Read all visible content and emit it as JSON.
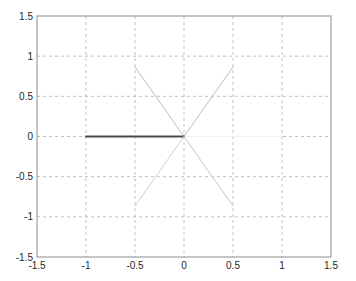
{
  "chart_data": {
    "type": "line",
    "title": "",
    "xlabel": "",
    "ylabel": "",
    "xlim": [
      -1.5,
      1.5
    ],
    "ylim": [
      -1.5,
      1.5
    ],
    "grid": true,
    "legend": null,
    "x_ticks": [
      -1.5,
      -1,
      -0.5,
      0,
      0.5,
      1,
      1.5
    ],
    "x_tick_labels": [
      "-1.5",
      "-1",
      "-0.5",
      "0",
      "0.5",
      "1",
      "1.5"
    ],
    "y_ticks": [
      -1.5,
      -1,
      -0.5,
      0,
      0.5,
      1,
      1.5
    ],
    "y_tick_labels": [
      "-1.5",
      "-1",
      "-0.5",
      "0",
      "0.5",
      "1",
      "1.5"
    ],
    "series": [
      {
        "name": "0deg",
        "x": [
          0,
          1
        ],
        "y": [
          0,
          0
        ],
        "color": "#f2f2f2",
        "width": 1.2
      },
      {
        "name": "60deg",
        "x": [
          0,
          0.5
        ],
        "y": [
          0,
          0.866
        ],
        "color": "#bdbdbd",
        "width": 1
      },
      {
        "name": "120deg",
        "x": [
          0,
          -0.5
        ],
        "y": [
          0,
          0.866
        ],
        "color": "#bdbdbd",
        "width": 1
      },
      {
        "name": "180deg",
        "x": [
          0,
          -1
        ],
        "y": [
          0,
          0
        ],
        "color": "#4a4a4a",
        "width": 2
      },
      {
        "name": "240deg",
        "x": [
          0,
          -0.5
        ],
        "y": [
          0,
          -0.866
        ],
        "color": "#d0d0d0",
        "width": 1
      },
      {
        "name": "300deg",
        "x": [
          0,
          0.5
        ],
        "y": [
          0,
          -0.866
        ],
        "color": "#c8c8c8",
        "width": 1
      }
    ]
  },
  "colors": {
    "axes": "#8c8c8c",
    "grid": "#a6a6a6",
    "background": "#ffffff"
  },
  "layout": {
    "plot_left": 37,
    "plot_top": 16,
    "plot_right": 331,
    "plot_bottom": 257
  }
}
